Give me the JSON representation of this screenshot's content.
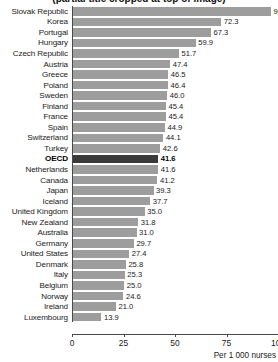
{
  "chart_data": {
    "type": "bar",
    "orientation": "horizontal",
    "title": "(partial title cropped at top of image)",
    "xlabel": "Per 1 000 nurses",
    "ylabel": "",
    "xlim": [
      0,
      100
    ],
    "xticks": [
      0,
      25,
      50,
      75,
      100
    ],
    "xtick_labels": [
      "0",
      "25",
      "50",
      "75",
      "100"
    ],
    "grid": false,
    "legend": "none",
    "highlight_category": "OECD",
    "bar_color": "#9d9d9d",
    "highlight_color": "#3a3a3a",
    "categories": [
      "Slovak Republic",
      "Korea",
      "Portugal",
      "Hungary",
      "Czech Republic",
      "Austria",
      "Greece",
      "Poland",
      "Sweden",
      "Finland",
      "France",
      "Spain",
      "Switzerland",
      "Turkey",
      "OECD",
      "Netherlands",
      "Canada",
      "Japan",
      "Iceland",
      "United Kingdom",
      "New Zealand",
      "Australia",
      "Germany",
      "United States",
      "Denmark",
      "Italy",
      "Belgium",
      "Norway",
      "Ireland",
      "Luxembourg"
    ],
    "values": [
      96.6,
      72.3,
      67.3,
      59.9,
      51.7,
      47.4,
      46.5,
      46.4,
      46.0,
      45.4,
      45.4,
      44.9,
      44.1,
      42.6,
      41.6,
      41.6,
      41.2,
      39.3,
      37.7,
      35.0,
      31.8,
      31.0,
      29.7,
      27.4,
      25.8,
      25.3,
      25.0,
      24.6,
      21.0,
      13.9
    ],
    "value_labels": [
      "96.6",
      "72.3",
      "67.3",
      "59.9",
      "51.7",
      "47.4",
      "46.5",
      "46.4",
      "46.0",
      "45.4",
      "45.4",
      "44.9",
      "44.1",
      "42.6",
      "41.6",
      "41.6",
      "41.2",
      "39.3",
      "37.7",
      "35.0",
      "31.8",
      "31.0",
      "29.7",
      "27.4",
      "25.8",
      "25.3",
      "25.0",
      "24.6",
      "21.0",
      "13.9"
    ]
  }
}
